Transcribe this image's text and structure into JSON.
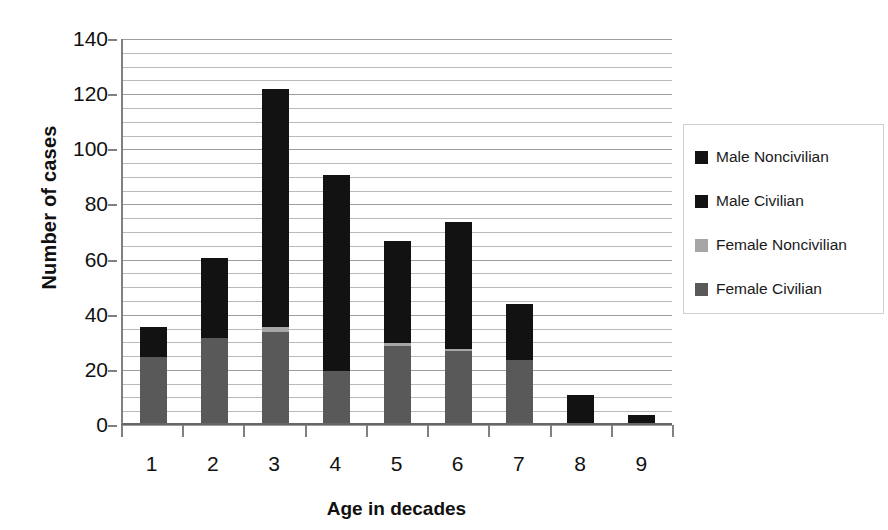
{
  "chart_data": {
    "type": "bar",
    "stacked": true,
    "title": "",
    "xlabel": "Age in decades",
    "ylabel": "Number of cases",
    "categories": [
      "1",
      "2",
      "3",
      "4",
      "5",
      "6",
      "7",
      "8",
      "9"
    ],
    "ylim": [
      0,
      140
    ],
    "ytick_values": [
      0,
      20,
      40,
      60,
      80,
      100,
      120,
      140
    ],
    "ytick_labels": [
      "0",
      "20",
      "40",
      "60",
      "80",
      "100",
      "120",
      "140"
    ],
    "gridline_step": 5,
    "grid": true,
    "legend_position": "right",
    "series": [
      {
        "name": "Female Civilian",
        "color": "#595959",
        "values": [
          24,
          31,
          33,
          19,
          28,
          26,
          23,
          0,
          0
        ]
      },
      {
        "name": "Female Noncivilian",
        "color": "#a6a6a6",
        "values": [
          0,
          0,
          2,
          0,
          1,
          1,
          0,
          0,
          0
        ]
      },
      {
        "name": "Male Civilian",
        "color": "#121212",
        "values": [
          11,
          29,
          86,
          71,
          37,
          46,
          20,
          10,
          3
        ]
      },
      {
        "name": "Male Noncivilian",
        "color": "#121212",
        "values": [
          0,
          0,
          0,
          0,
          0,
          0,
          0,
          0,
          0
        ]
      }
    ],
    "totals": [
      35,
      60,
      121,
      90,
      66,
      73,
      43,
      10,
      3
    ]
  },
  "legend": {
    "entries": [
      {
        "label": "Male Noncivilian",
        "color": "#121212"
      },
      {
        "label": "Male Civilian",
        "color": "#121212"
      },
      {
        "label": "Female Noncivilian",
        "color": "#a6a6a6"
      },
      {
        "label": "Female Civilian",
        "color": "#595959"
      }
    ]
  },
  "axis": {
    "y_title": "Number of cases",
    "x_title": "Age in decades"
  }
}
